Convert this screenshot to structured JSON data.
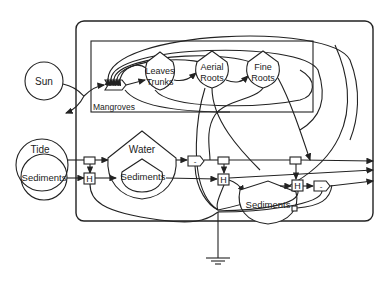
{
  "diagram": {
    "type": "energy-systems-diagram",
    "sources": [
      {
        "id": "sun",
        "label": "Sun"
      },
      {
        "id": "tide",
        "label": "Tide"
      },
      {
        "id": "tide-sediments",
        "label": "Sediments"
      }
    ],
    "subsystem": {
      "label": "Mangroves"
    },
    "storages": [
      {
        "id": "leaves-trunks",
        "label_line1": "Leaves",
        "label_line2": "Trunks"
      },
      {
        "id": "aerial-roots",
        "label_line1": "Aerial",
        "label_line2": "Roots"
      },
      {
        "id": "fine-roots",
        "label_line1": "Fine",
        "label_line2": "Roots"
      },
      {
        "id": "water",
        "label": "Water"
      },
      {
        "id": "water-sediments",
        "label": "Sediments"
      },
      {
        "id": "bottom-sediments",
        "label": "Sediments"
      }
    ],
    "interactions": [
      {
        "id": "production",
        "symbol": "work-gate"
      },
      {
        "id": "h1",
        "label": "H"
      },
      {
        "id": "h2",
        "label": "H"
      },
      {
        "id": "h3",
        "label": "H"
      },
      {
        "id": "x1",
        "label": "-"
      },
      {
        "id": "x2",
        "label": "-"
      }
    ],
    "sink": {
      "id": "heat-sink",
      "symbol": "ground"
    },
    "outputs": 3
  }
}
